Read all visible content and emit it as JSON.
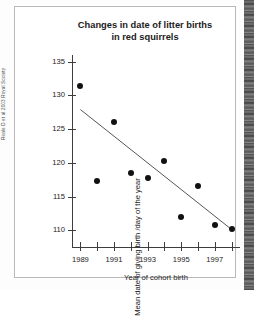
{
  "credit": "Reale D et al 2003 Royal Society",
  "chart_data": {
    "type": "scatter",
    "title": "Changes in date of litter births in red squirrels",
    "title_lines": [
      "Changes in date of litter births",
      "in red squirrels"
    ],
    "xlabel": "Year of cohort  birth",
    "ylabel": "Mean date of giving birth /day of the year",
    "x": [
      1989,
      1990,
      1991,
      1992,
      1993,
      1994,
      1995,
      1996,
      1997,
      1998
    ],
    "values": [
      131.4,
      117.3,
      126.0,
      118.5,
      117.7,
      120.2,
      112.0,
      116.5,
      110.7,
      110.2
    ],
    "xlim": [
      1988.5,
      1998.5
    ],
    "ylim": [
      107.5,
      136.0
    ],
    "ytick_labels": [
      "135",
      "130",
      "125",
      "120",
      "115",
      "110"
    ],
    "ytick_values": [
      135,
      130,
      125,
      120,
      115,
      110
    ],
    "xtick_values": [
      1989,
      1990,
      1991,
      1992,
      1993,
      1994,
      1995,
      1996,
      1997,
      1998
    ],
    "xtick_labels": [
      "1989",
      "",
      "1991",
      "",
      "1993",
      "",
      "1995",
      "",
      "1997",
      ""
    ],
    "grid": false,
    "legend": "none",
    "trendline": {
      "label": "linear regression",
      "x_start": 1989.0,
      "y_start": 127.9,
      "x_end": 1998.0,
      "y_end": 110.1,
      "color": "#555555"
    },
    "marker_color": "#111111",
    "axis_color": "#3d3d3d"
  }
}
